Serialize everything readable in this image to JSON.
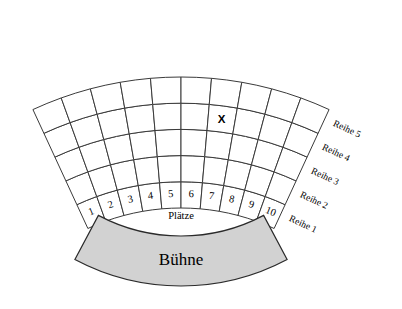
{
  "diagram": {
    "type": "seating-chart-sector"
  },
  "geometry": {
    "center_x": 181,
    "center_y": 430,
    "inner_radius": 222,
    "outer_radius": 353,
    "start_angle_deg": -114.8,
    "end_angle_deg": -65.2,
    "rows": 5,
    "seats_per_row": 10
  },
  "colors": {
    "grid_stroke": "#3a3a3a",
    "seat_fill": "#ffffff",
    "stage_fill": "#d2d2d2",
    "stage_stroke": "#2a2a2a",
    "text": "#000000"
  },
  "rows": {
    "caption": "Reihe",
    "labels": [
      "Reihe 1",
      "Reihe 2",
      "Reihe 3",
      "Reihe 4",
      "Reihe 5"
    ]
  },
  "seats": {
    "caption": "Plätze",
    "numbers": [
      "1",
      "2",
      "3",
      "4",
      "5",
      "6",
      "7",
      "8",
      "9",
      "10"
    ]
  },
  "marker": {
    "symbol": "X",
    "seat_number": "7",
    "row_label": "Reihe 4"
  },
  "stage": {
    "label": "Bühne"
  }
}
